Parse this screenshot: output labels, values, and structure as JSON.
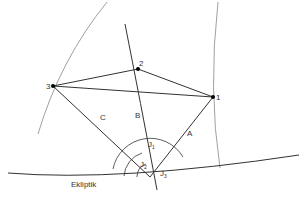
{
  "diagram": {
    "points": [
      {
        "id": "1",
        "label": "1",
        "x": 213,
        "y": 97
      },
      {
        "id": "2",
        "label": "2",
        "x": 138,
        "y": 69
      },
      {
        "id": "3",
        "label": "3",
        "x": 53,
        "y": 86
      }
    ],
    "vertex": {
      "x": 150,
      "y": 177
    },
    "lines": [
      {
        "id": "A",
        "label": "A"
      },
      {
        "id": "B",
        "label": "B"
      },
      {
        "id": "C",
        "label": "C"
      }
    ],
    "angles": [
      {
        "id": "J1",
        "label": "J",
        "sub": "1"
      },
      {
        "id": "J2",
        "label": "J",
        "sub": "2"
      },
      {
        "id": "J3",
        "label": "J",
        "sub": "3"
      }
    ],
    "ecliptic_label": "Ekliptik",
    "colors": {
      "line": "#333333",
      "thin": "#777777",
      "point": "#000000"
    }
  }
}
